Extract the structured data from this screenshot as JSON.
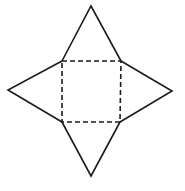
{
  "diagram": {
    "type": "net-of-square-pyramid",
    "background": "#ffffff",
    "stroke_color": "#1a1a1a",
    "square_base": {
      "style": "dashed",
      "corners": [
        [
          62,
          61
        ],
        [
          121,
          61
        ],
        [
          120,
          122
        ],
        [
          62,
          122
        ]
      ]
    },
    "triangles": [
      {
        "name": "top",
        "apex": [
          91,
          6
        ],
        "base": [
          [
            62,
            61
          ],
          [
            121,
            61
          ]
        ]
      },
      {
        "name": "right",
        "apex": [
          172,
          91
        ],
        "base": [
          [
            121,
            61
          ],
          [
            120,
            122
          ]
        ]
      },
      {
        "name": "bottom",
        "apex": [
          91,
          176
        ],
        "base": [
          [
            120,
            122
          ],
          [
            62,
            122
          ]
        ]
      },
      {
        "name": "left",
        "apex": [
          8,
          90
        ],
        "base": [
          [
            62,
            122
          ],
          [
            62,
            61
          ]
        ]
      }
    ]
  }
}
